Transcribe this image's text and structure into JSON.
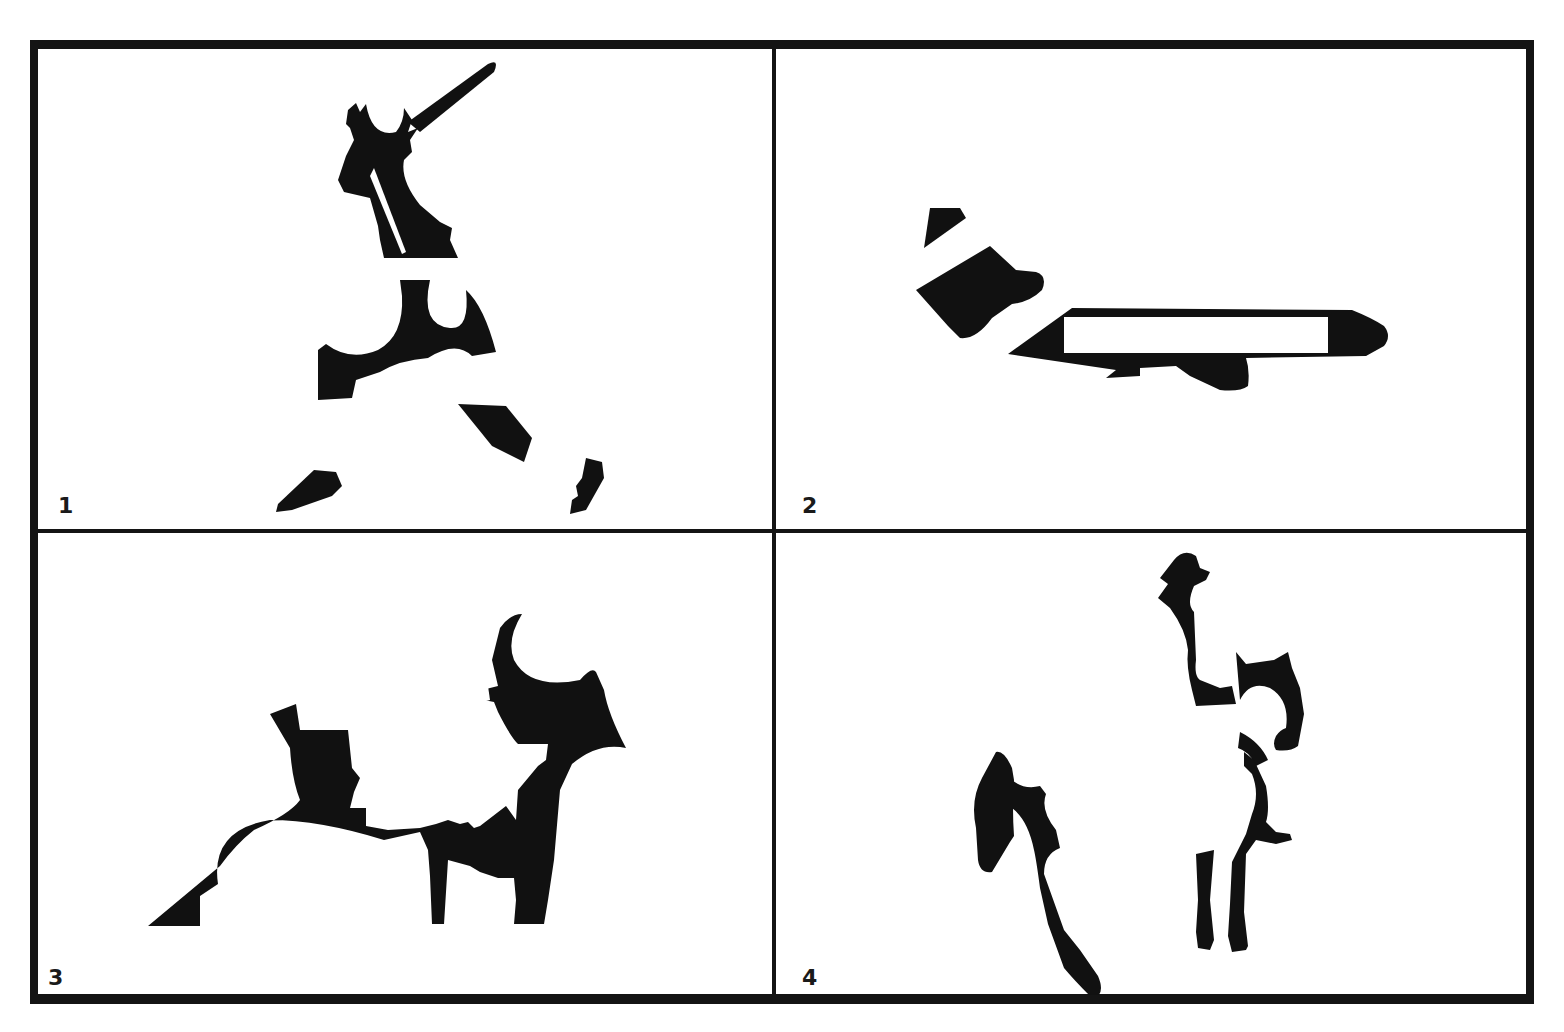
{
  "figure": {
    "panels": [
      {
        "number": "1",
        "subject": "baseball-batter-silhouette"
      },
      {
        "number": "2",
        "subject": "airplane-silhouette"
      },
      {
        "number": "3",
        "subject": "person-with-glasses-and-hand-silhouette"
      },
      {
        "number": "4",
        "subject": "cowboy-on-horse-silhouette"
      }
    ],
    "colors": {
      "ink": "#111111",
      "background": "#ffffff",
      "frame": "#141414"
    }
  }
}
